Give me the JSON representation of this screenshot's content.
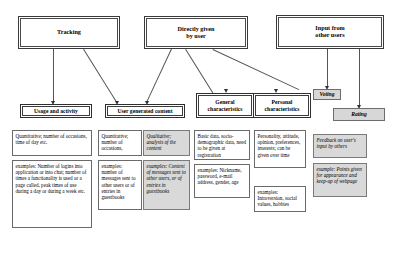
{
  "diagram": {
    "colors": {
      "shaded_fill": "#d9d9d9",
      "box_stroke": "#3a3a3a",
      "connector": "#555555"
    },
    "level1": [
      {
        "id": "tracking",
        "label": "Tracking"
      },
      {
        "id": "directly-given",
        "label": "Directly given\nby user"
      },
      {
        "id": "input-other-users",
        "label": "Input from\nother users"
      }
    ],
    "level2": [
      {
        "id": "usage-activity",
        "label": "Usage and  activity",
        "shaded": false
      },
      {
        "id": "user-generated-content",
        "label": "User generated content",
        "shaded": false
      },
      {
        "id": "general-characteristics",
        "label": "General\ncharacteristics",
        "shaded": false
      },
      {
        "id": "personal-characteristics",
        "label": "Personal\ncharacteristics",
        "shaded": false
      },
      {
        "id": "voting",
        "label": "Voting",
        "shaded": true
      },
      {
        "id": "rating",
        "label": "Rating",
        "shaded": true
      }
    ],
    "leaves": [
      {
        "id": "usage-type",
        "shaded": false,
        "text": "Quantitative; number of occasions, time of day etc."
      },
      {
        "id": "usage-examples",
        "shaded": false,
        "text": "examples: Number of logins into application or into chat; number of times a functionality is used or a page called,  peak times of use during a day or during a week etc."
      },
      {
        "id": "ugc-quantitative-type",
        "shaded": false,
        "text": "Quantitative; number of occasions,"
      },
      {
        "id": "ugc-quantitative-examples",
        "shaded": false,
        "text": "examples: number of messages sent to other users or of entries in guestbooks"
      },
      {
        "id": "ugc-qualitative-type",
        "shaded": true,
        "text": "Qualitative; analysis of the content"
      },
      {
        "id": "ugc-qualitative-examples",
        "shaded": true,
        "text": "examples: Content of messages sent to other users, or of entries in guestbooks"
      },
      {
        "id": "general-type",
        "shaded": false,
        "text": "Basic data, socio-demographic data, need to be given at registration"
      },
      {
        "id": "general-examples",
        "shaded": false,
        "text": "examples: Nickname, password, e-mail address, gender, age"
      },
      {
        "id": "personal-type",
        "shaded": false,
        "text": "Personality, attitude, opinion, preferences, interests; can be given over time"
      },
      {
        "id": "personal-examples",
        "shaded": false,
        "text": "examples: Introversion, social values, hobbies"
      },
      {
        "id": "feedback-type",
        "shaded": true,
        "text": "Feedback on user's input by others"
      },
      {
        "id": "feedback-examples",
        "shaded": true,
        "text": "example: Points given for appearance and keep-up of webpage"
      }
    ]
  }
}
